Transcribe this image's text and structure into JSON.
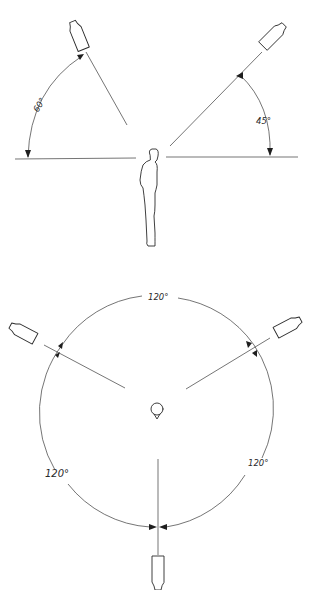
{
  "diagram": {
    "top": {
      "description": "Side view: person standing with two lights elevated above horizon",
      "left_light": {
        "angle_label": "60°",
        "angle_deg": 60
      },
      "right_light": {
        "angle_label": "45°",
        "angle_deg": 45
      }
    },
    "bottom": {
      "description": "Plan view: subject at center with three lights spaced evenly around a circle",
      "arc_labels": [
        "120°",
        "120°",
        "120°"
      ],
      "spacing_deg": 120,
      "light_count": 3
    }
  },
  "colors": {
    "line": "#2a2a2a",
    "background": "#ffffff"
  }
}
